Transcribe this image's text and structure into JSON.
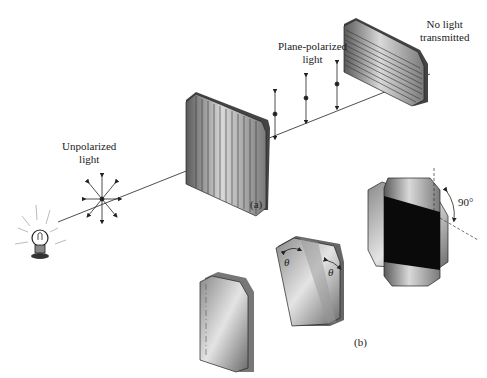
{
  "labels": {
    "unpolarized": [
      "Unpolarized",
      "light"
    ],
    "plane_polarized": [
      "Plane-polarized",
      "light"
    ],
    "no_light": [
      "No light",
      "transmitted"
    ],
    "part_a": "(a)",
    "part_b": "(b)",
    "theta_left": "θ",
    "theta_right": "θ",
    "angle_90": "90°"
  },
  "colors": {
    "line": "#222222",
    "plate_dark": "#555555",
    "plate_light": "#d8d8d8",
    "black_overlap": "#0a0a0a"
  }
}
